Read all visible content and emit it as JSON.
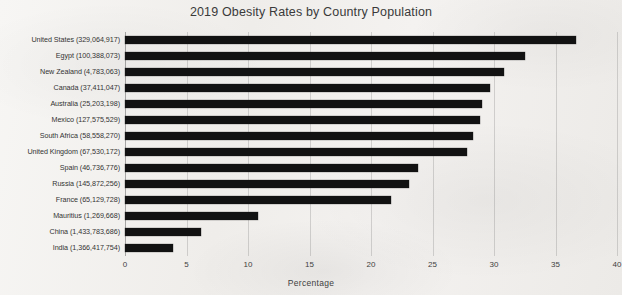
{
  "chart_data": {
    "type": "bar",
    "orientation": "horizontal",
    "title": "2019 Obesity Rates by Country Population",
    "xlabel": "Percentage",
    "ylabel": "",
    "xlim": [
      0,
      40
    ],
    "xticks": [
      0,
      5,
      10,
      15,
      20,
      25,
      30,
      35,
      40
    ],
    "grid": true,
    "legend": false,
    "bar_color": "#121212",
    "background_color": "#f2f0ee",
    "categories": [
      "United States (329,064,917)",
      "Egypt (100,388,073)",
      "New Zealand (4,783,063)",
      "Canada (37,411,047)",
      "Australia (25,203,198)",
      "Mexico (127,575,529)",
      "South Africa (58,558,270)",
      "United Kingdom (67,530,172)",
      "Spain (46,736,776)",
      "Russia (145,872,256)",
      "France (65,129,728)",
      "Mauritius (1,269,668)",
      "China (1,433,783,686)",
      "India (1,366,417,754)"
    ],
    "values": [
      36.7,
      32.5,
      30.8,
      29.7,
      29.0,
      28.9,
      28.3,
      27.8,
      23.8,
      23.1,
      21.6,
      10.8,
      6.2,
      3.9
    ]
  }
}
